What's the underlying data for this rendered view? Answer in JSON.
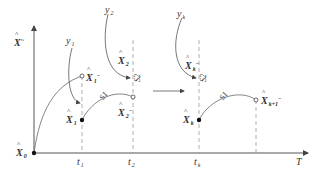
{
  "diagram": {
    "type": "state-estimation timeline",
    "axes": {
      "y_label": {
        "base": "X",
        "sup": "~"
      },
      "x_label": "T"
    },
    "time_ticks": [
      {
        "id": "t1",
        "base": "t",
        "sub": "1"
      },
      {
        "id": "t2",
        "base": "t",
        "sub": "2"
      },
      {
        "id": "tk",
        "base": "t",
        "sub": "k"
      }
    ],
    "origin_state": {
      "base": "X",
      "sub": "0"
    },
    "observations": [
      {
        "id": "y1",
        "base": "y",
        "sub": "1"
      },
      {
        "id": "y2",
        "base": "y",
        "sub": "2"
      },
      {
        "id": "yk",
        "base": "y",
        "sub": "k"
      }
    ],
    "states": [
      {
        "id": "X1-",
        "base": "X",
        "sub": "1",
        "sup": "−",
        "marker": "open"
      },
      {
        "id": "X1",
        "base": "X",
        "sub": "1",
        "marker": "filled"
      },
      {
        "id": "X2-",
        "base": "X",
        "sub": "2",
        "sup": "−",
        "marker": "open"
      },
      {
        "id": "X2",
        "base": "X",
        "sub": "2",
        "marker": "none"
      },
      {
        "id": "Xk-",
        "base": "X",
        "sub": "k",
        "sup": "−",
        "marker": "none"
      },
      {
        "id": "Xk",
        "base": "X",
        "sub": "k",
        "marker": "filled"
      },
      {
        "id": "Xk+1-",
        "base": "X",
        "sub": "k+1",
        "sup": "−",
        "marker": "open"
      }
    ],
    "step_labels": {
      "s1": "S1",
      "s2": "S2"
    },
    "colors": {
      "line": "#555555",
      "dashed": "#999999",
      "text": "#333333",
      "background": "#ffffff"
    }
  }
}
